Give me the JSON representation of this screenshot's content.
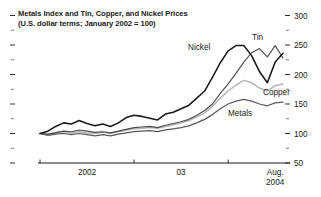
{
  "chart_data": {
    "type": "line",
    "title": "Metals Index and Tin, Copper, and Nickel Prices",
    "subtitle": "(U.S. dollar terms; January 2002 = 100)",
    "xlabel": "",
    "ylabel": "",
    "ylim": [
      50,
      300
    ],
    "y_major_ticks": [
      50,
      100,
      150,
      200,
      250,
      300
    ],
    "y_tick_labels": [
      "50",
      "100",
      "150",
      "200",
      "250",
      "300"
    ],
    "y_minor_ticks": [
      75,
      125,
      175,
      225,
      275
    ],
    "grid": false,
    "legend_position": "inline-annotations",
    "x_tick_labels": [
      "2002",
      "03",
      "Aug.",
      "2004"
    ],
    "x_axis_caption_last": "Aug.\n2004",
    "x_start": "Jan 2002",
    "x_end": "Aug 2004",
    "n_points": 32,
    "x": [
      "2002-01",
      "2002-02",
      "2002-03",
      "2002-04",
      "2002-05",
      "2002-06",
      "2002-07",
      "2002-08",
      "2002-09",
      "2002-10",
      "2002-11",
      "2002-12",
      "2003-01",
      "2003-02",
      "2003-03",
      "2003-04",
      "2003-05",
      "2003-06",
      "2003-07",
      "2003-08",
      "2003-09",
      "2003-10",
      "2003-11",
      "2003-12",
      "2004-01",
      "2004-02",
      "2004-03",
      "2004-04",
      "2004-05",
      "2004-06",
      "2004-07",
      "2004-08"
    ],
    "series": [
      {
        "name": "Nickel",
        "color": "#1a1a1a",
        "width": 1.55,
        "label_x": 188,
        "label_y": 50,
        "values": [
          100,
          104,
          112,
          118,
          116,
          122,
          117,
          113,
          116,
          112,
          118,
          127,
          131,
          129,
          126,
          123,
          133,
          136,
          142,
          148,
          160,
          172,
          195,
          220,
          240,
          249,
          249,
          232,
          205,
          186,
          221,
          236
        ]
      },
      {
        "name": "Tin",
        "color": "#4d4d4d",
        "width": 1.15,
        "label_x": 252,
        "label_y": 40,
        "values": [
          100,
          99,
          101,
          104,
          103,
          106,
          104,
          102,
          103,
          101,
          104,
          107,
          110,
          111,
          112,
          110,
          114,
          117,
          120,
          124,
          131,
          139,
          150,
          168,
          184,
          202,
          221,
          237,
          244,
          230,
          249,
          228
        ]
      },
      {
        "name": "Copper",
        "color": "#b5b5b5",
        "width": 1.5,
        "label_x": 263,
        "label_y": 95,
        "values": [
          100,
          98,
          102,
          103,
          101,
          103,
          101,
          100,
          102,
          100,
          103,
          106,
          108,
          109,
          110,
          109,
          112,
          115,
          118,
          122,
          128,
          135,
          146,
          160,
          172,
          182,
          190,
          186,
          177,
          172,
          181,
          184
        ]
      },
      {
        "name": "Metals",
        "color": "#595959",
        "width": 1.25,
        "label_x": 228,
        "label_y": 116,
        "values": [
          100,
          97,
          99,
          100,
          98,
          100,
          98,
          96,
          98,
          96,
          99,
          101,
          103,
          104,
          105,
          103,
          106,
          108,
          110,
          113,
          118,
          124,
          132,
          142,
          150,
          155,
          158,
          155,
          150,
          147,
          152,
          153
        ]
      }
    ]
  }
}
